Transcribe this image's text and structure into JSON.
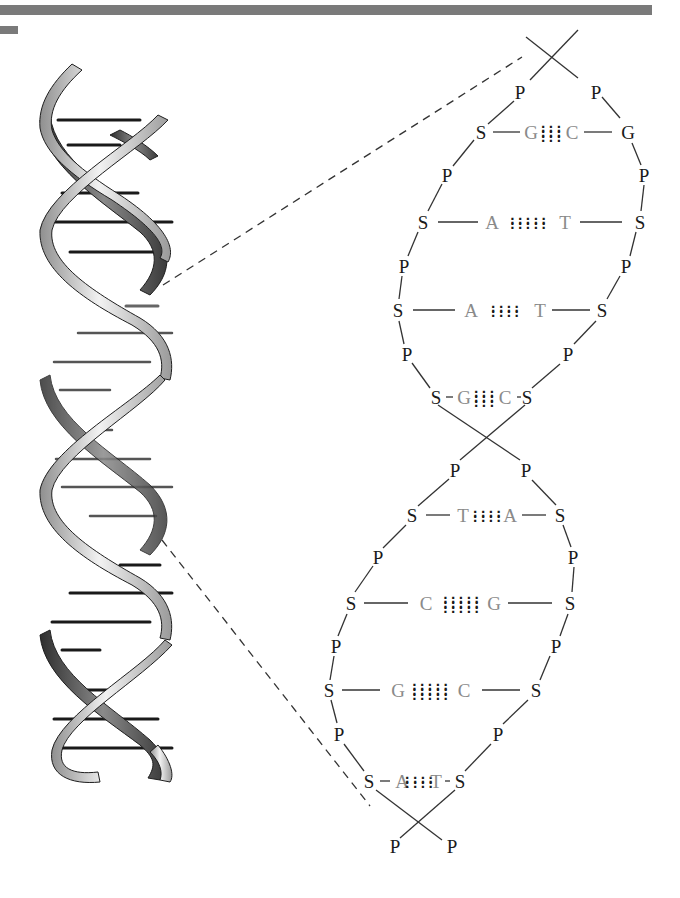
{
  "figure": {
    "colors": {
      "backbone_text": "#1a1a1a",
      "base_text": "#8a8a8a",
      "ribbon_light": "#d9d9d9",
      "ribbon_dark": "#4a4a4a",
      "rung": "#1a1a1a",
      "header_bar": "#7a7a7a"
    }
  },
  "ladder": {
    "top_strand_ends": [
      "P",
      "P"
    ],
    "rows": [
      {
        "left": "S",
        "base_left": "G",
        "base_right": "C",
        "right": "G",
        "bonds": 3
      },
      {
        "left": "S",
        "base_left": "A",
        "base_right": "T",
        "right": "S",
        "bonds": 2
      },
      {
        "left": "S",
        "base_left": "A",
        "base_right": "T",
        "right": "S",
        "bonds": 2
      },
      {
        "left": "S",
        "base_left": "G",
        "base_right": "C",
        "right": "S",
        "bonds": 3
      },
      {
        "left": "S",
        "base_left": "T",
        "base_right": "A",
        "right": "S",
        "bonds": 2
      },
      {
        "left": "S",
        "base_left": "C",
        "base_right": "G",
        "right": "S",
        "bonds": 3
      },
      {
        "left": "S",
        "base_left": "G",
        "base_right": "C",
        "right": "S",
        "bonds": 3
      },
      {
        "left": "S",
        "base_left": "A",
        "base_right": "T",
        "right": "S",
        "bonds": 2
      }
    ],
    "phosphates_between_rows": [
      [
        "P",
        "P"
      ],
      [
        "P",
        "P"
      ],
      [
        "P",
        "P"
      ],
      [
        "P",
        "P"
      ],
      [
        "P",
        "P"
      ],
      [
        "P",
        "P"
      ],
      [
        "P",
        "P"
      ],
      [
        "P",
        "P"
      ]
    ],
    "bottom_strand_ends": [
      "P",
      "P"
    ]
  },
  "labels": {
    "P": "P",
    "S": "S",
    "G": "G",
    "C": "C",
    "A": "A",
    "T": "T",
    "hb2": "::::\n::::",
    "hb3": ":::\n:::\n:::",
    "hb2w": ":::::\n:::::",
    "hb3w": ":::::\n:::::\n:::::"
  }
}
